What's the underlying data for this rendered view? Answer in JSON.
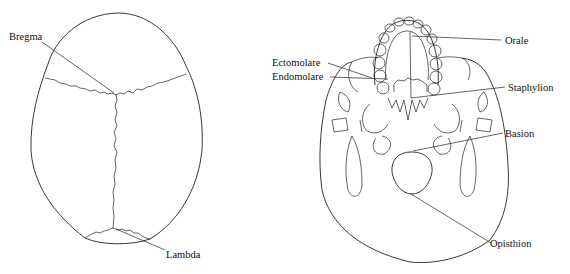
{
  "figure": {
    "left_view": {
      "description": "Superior view of skull (norma verticalis)",
      "labels": [
        {
          "id": "bregma",
          "text": "Bregma"
        },
        {
          "id": "lambda",
          "text": "Lambda"
        }
      ]
    },
    "right_view": {
      "description": "Inferior view of skull (norma basilaris)",
      "labels": [
        {
          "id": "orale",
          "text": "Orale"
        },
        {
          "id": "ectomolare",
          "text": "Ectomolare"
        },
        {
          "id": "endomolare",
          "text": "Endomolare"
        },
        {
          "id": "staphylion",
          "text": "Staphylion"
        },
        {
          "id": "basion",
          "text": "Basion"
        },
        {
          "id": "opisthion",
          "text": "Opisthion"
        }
      ]
    }
  },
  "colors": {
    "line": "#222222",
    "background": "#ffffff"
  }
}
